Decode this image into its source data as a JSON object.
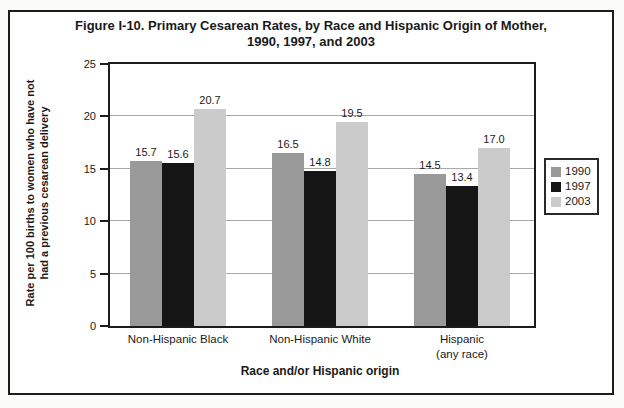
{
  "figure": {
    "title_line1": "Figure I-10. Primary Cesarean Rates, by Race and Hispanic Origin of Mother,",
    "title_line2": "1990, 1997, and 2003",
    "ylabel_line1": "Rate per 100 births to women who have not",
    "ylabel_line2": "had a previous cesarean delivery"
  },
  "chart_data": {
    "type": "bar",
    "title": "Figure I-10. Primary Cesarean Rates, by Race and Hispanic Origin of Mother, 1990, 1997, and 2003",
    "categories": [
      "Non-Hispanic Black",
      "Non-Hispanic White",
      "Hispanic (any race)"
    ],
    "categories_display": [
      [
        "Non-Hispanic Black"
      ],
      [
        "Non-Hispanic White"
      ],
      [
        "Hispanic",
        "(any race)"
      ]
    ],
    "series": [
      {
        "name": "1990",
        "color": "#999999",
        "values": [
          15.7,
          16.5,
          14.5
        ],
        "labels": [
          "15.7",
          "16.5",
          "14.5"
        ]
      },
      {
        "name": "1997",
        "color": "#151515",
        "values": [
          15.6,
          14.8,
          13.4
        ],
        "labels": [
          "15.6",
          "14.8",
          "13.4"
        ]
      },
      {
        "name": "2003",
        "color": "#cbcbcb",
        "values": [
          20.7,
          19.5,
          17.0
        ],
        "labels": [
          "20.7",
          "19.5",
          "17.0"
        ]
      }
    ],
    "xlabel": "Race and/or Hispanic origin",
    "ylabel": "Rate per 100 births to women who have not had a previous cesarean delivery",
    "ylim": [
      0,
      25
    ],
    "yticks": [
      0,
      5,
      10,
      15,
      20,
      25
    ],
    "grid": true,
    "legend_position": "right",
    "colors": {
      "axis": "#1c1c1c",
      "grid": "#a9a9a9",
      "frame_border": "#1c1c1c",
      "background": "#ffffff"
    }
  }
}
